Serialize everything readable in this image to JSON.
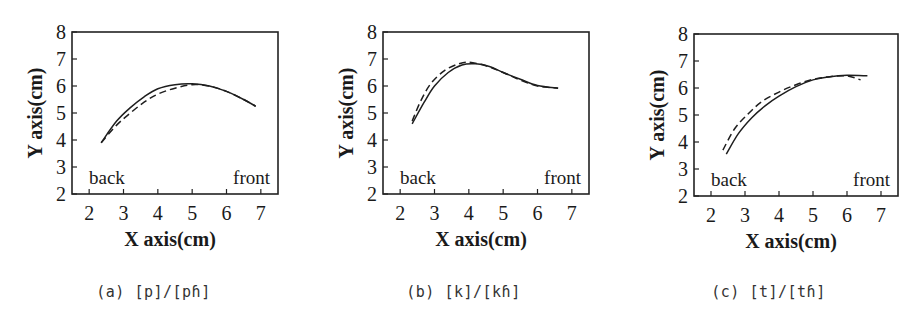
{
  "figure": {
    "panels": [
      {
        "id": "a",
        "caption": "(a) [p]/[pɦ]"
      },
      {
        "id": "b",
        "caption": "(b) [k]/[kɦ]"
      },
      {
        "id": "c",
        "caption": "(c) [t]/[tɦ]"
      }
    ]
  },
  "chart_data": [
    {
      "type": "line",
      "title": "(a) [p]/[pɦ]",
      "xlabel": "X axis(cm)",
      "ylabel": "Y axis(cm)",
      "xlim": [
        1.5,
        7.5
      ],
      "ylim": [
        2,
        8
      ],
      "xticks": [
        2,
        3,
        4,
        5,
        6,
        7
      ],
      "yticks": [
        2,
        3,
        4,
        5,
        6,
        7,
        8
      ],
      "grid": false,
      "annotations": [
        {
          "text": "back",
          "x": 2.5,
          "y": 2.5
        },
        {
          "text": "front",
          "x": 6.7,
          "y": 2.5
        }
      ],
      "series": [
        {
          "name": "[p]",
          "style": "solid",
          "x": [
            2.35,
            2.8,
            3.2,
            3.6,
            4.0,
            4.5,
            5.0,
            5.5,
            6.0,
            6.5,
            6.85
          ],
          "y": [
            3.9,
            4.7,
            5.2,
            5.6,
            5.9,
            6.05,
            6.08,
            6.0,
            5.8,
            5.5,
            5.25
          ]
        },
        {
          "name": "[pɦ]",
          "style": "dashed",
          "x": [
            2.35,
            2.8,
            3.2,
            3.6,
            4.0,
            4.5,
            5.0,
            5.5,
            6.0,
            6.5,
            6.85
          ],
          "y": [
            3.9,
            4.55,
            5.0,
            5.4,
            5.7,
            5.92,
            6.05,
            6.0,
            5.8,
            5.5,
            5.25
          ]
        }
      ]
    },
    {
      "type": "line",
      "title": "(b) [k]/[kɦ]",
      "xlabel": "X axis(cm)",
      "ylabel": "Y axis(cm)",
      "xlim": [
        1.5,
        7.5
      ],
      "ylim": [
        2,
        8
      ],
      "xticks": [
        2,
        3,
        4,
        5,
        6,
        7
      ],
      "yticks": [
        2,
        3,
        4,
        5,
        6,
        7,
        8
      ],
      "grid": false,
      "annotations": [
        {
          "text": "back",
          "x": 2.5,
          "y": 2.5
        },
        {
          "text": "front",
          "x": 6.7,
          "y": 2.5
        }
      ],
      "series": [
        {
          "name": "[k]",
          "style": "solid",
          "x": [
            2.35,
            2.7,
            3.0,
            3.4,
            3.8,
            4.2,
            4.6,
            5.0,
            5.5,
            6.0,
            6.6
          ],
          "y": [
            4.6,
            5.4,
            6.0,
            6.5,
            6.78,
            6.82,
            6.72,
            6.5,
            6.25,
            6.02,
            5.92
          ]
        },
        {
          "name": "[kɦ]",
          "style": "dashed",
          "x": [
            2.35,
            2.6,
            2.9,
            3.3,
            3.7,
            4.0,
            4.5,
            5.0,
            5.5,
            6.0,
            6.6
          ],
          "y": [
            4.7,
            5.45,
            6.1,
            6.58,
            6.82,
            6.88,
            6.75,
            6.5,
            6.22,
            6.0,
            5.92
          ]
        }
      ]
    },
    {
      "type": "line",
      "title": "(c) [t]/[tɦ]",
      "xlabel": "X axis(cm)",
      "ylabel": "Y axis(cm)",
      "xlim": [
        1.5,
        7.5
      ],
      "ylim": [
        2,
        8
      ],
      "xticks": [
        2,
        3,
        4,
        5,
        6,
        7
      ],
      "yticks": [
        2,
        3,
        4,
        5,
        6,
        7,
        8
      ],
      "grid": false,
      "annotations": [
        {
          "text": "back",
          "x": 2.5,
          "y": 2.5
        },
        {
          "text": "front",
          "x": 6.7,
          "y": 2.5
        }
      ],
      "series": [
        {
          "name": "[t]",
          "style": "solid",
          "x": [
            2.45,
            2.8,
            3.2,
            3.6,
            4.0,
            4.5,
            5.0,
            5.5,
            6.0,
            6.6
          ],
          "y": [
            3.55,
            4.3,
            4.9,
            5.35,
            5.7,
            6.05,
            6.3,
            6.42,
            6.47,
            6.45
          ]
        },
        {
          "name": "[tɦ]",
          "style": "dashed",
          "x": [
            2.35,
            2.7,
            3.1,
            3.5,
            4.0,
            4.5,
            5.0,
            5.5,
            6.0,
            6.4
          ],
          "y": [
            3.7,
            4.5,
            5.05,
            5.5,
            5.85,
            6.12,
            6.32,
            6.42,
            6.45,
            6.3
          ]
        }
      ]
    }
  ]
}
